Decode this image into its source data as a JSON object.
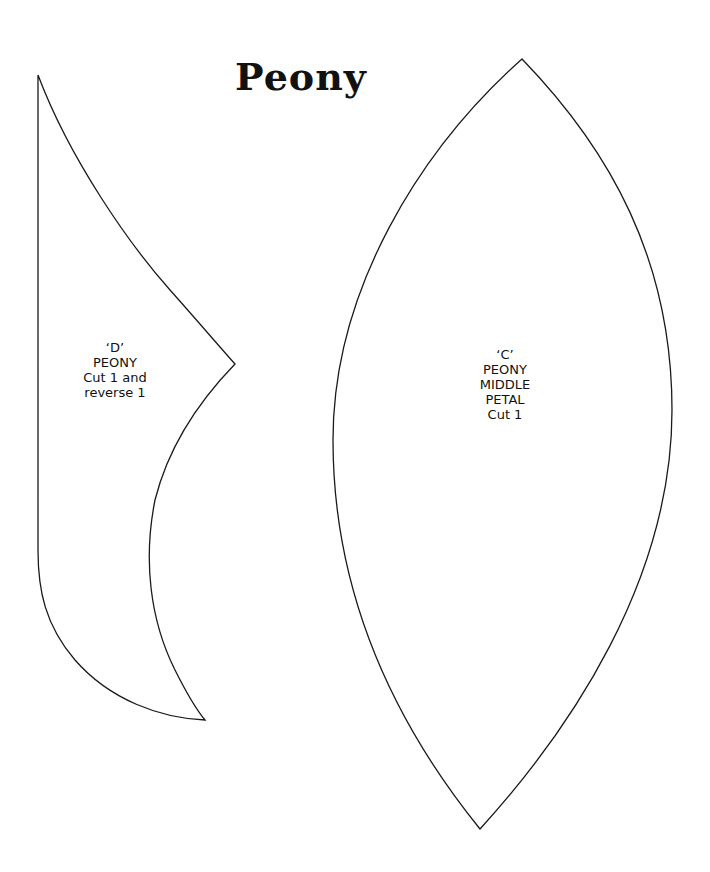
{
  "document": {
    "title": "Peony",
    "stroke_color": "#1a1a1a",
    "background": "#ffffff"
  },
  "pieces": [
    {
      "id": "D",
      "lines": [
        "‘D’",
        "PEONY",
        "Cut 1 and",
        "reverse 1"
      ]
    },
    {
      "id": "C",
      "lines": [
        "‘C’",
        "PEONY",
        "MIDDLE",
        "PETAL",
        "Cut 1"
      ]
    }
  ]
}
